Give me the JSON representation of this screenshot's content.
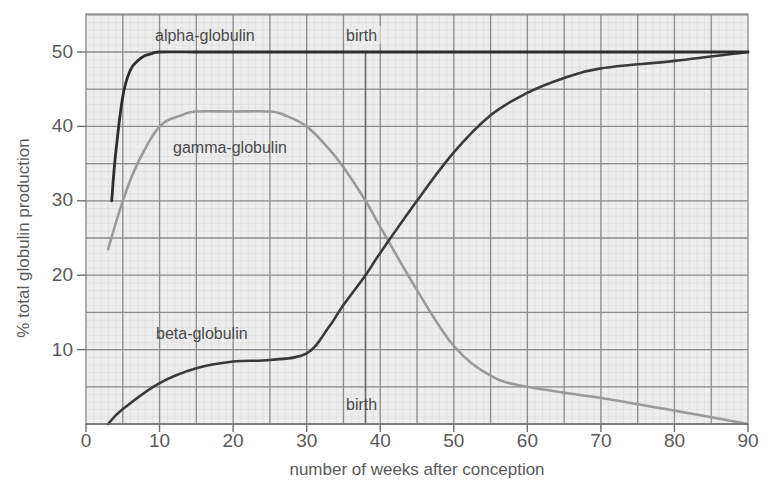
{
  "chart_data": {
    "type": "line",
    "title": "",
    "xlabel": "number of weeks after conception",
    "ylabel": "% total globulin production",
    "xlim": [
      0,
      90
    ],
    "ylim": [
      0,
      55
    ],
    "xticks": [
      0,
      10,
      20,
      30,
      40,
      50,
      60,
      70,
      80,
      90
    ],
    "yticks": [
      10,
      20,
      30,
      40,
      50
    ],
    "xtick_labels": [
      "0",
      "10",
      "20",
      "30",
      "40",
      "50",
      "60",
      "70",
      "80",
      "90"
    ],
    "ytick_labels": [
      "10",
      "20",
      "30",
      "40",
      "50"
    ],
    "grid": true,
    "background": "graph paper",
    "annotations": [
      {
        "text": "birth",
        "x": 38,
        "position": "top"
      },
      {
        "text": "birth",
        "x": 38,
        "position": "bottom"
      }
    ],
    "vline": {
      "x": 38,
      "label": "birth"
    },
    "series": [
      {
        "name": "alpha-globulin",
        "color": "#333333",
        "x": [
          3.5,
          4,
          5,
          6,
          7,
          8,
          9,
          10,
          15,
          20,
          30,
          40,
          50,
          60,
          70,
          80,
          90
        ],
        "y": [
          30,
          36,
          44,
          47.5,
          48.8,
          49.5,
          49.8,
          50,
          50,
          50,
          50,
          50,
          50,
          50,
          50,
          50,
          50
        ]
      },
      {
        "name": "gamma-globulin",
        "color": "#999999",
        "x": [
          3,
          5,
          7,
          10,
          13,
          15,
          20,
          25,
          27,
          30,
          33,
          35,
          38,
          40,
          45,
          50,
          55,
          60,
          70,
          80,
          90
        ],
        "y": [
          23.5,
          30,
          35,
          40,
          41.5,
          42,
          42,
          42,
          41.5,
          40,
          37,
          34.5,
          30,
          26.5,
          18,
          10.5,
          6.5,
          5,
          3.5,
          1.8,
          0
        ]
      },
      {
        "name": "beta-globulin",
        "color": "#3a3a3a",
        "x": [
          3,
          5,
          10,
          15,
          20,
          25,
          30,
          33,
          35,
          38,
          40,
          45,
          50,
          55,
          60,
          65,
          70,
          80,
          90
        ],
        "y": [
          0,
          2,
          5.5,
          7.5,
          8.4,
          8.6,
          9.5,
          13,
          16,
          20,
          23,
          30,
          36.5,
          41.5,
          44.5,
          46.5,
          47.8,
          48.8,
          50
        ]
      }
    ],
    "curve_labels": [
      {
        "text": "alpha-globulin",
        "x": 15,
        "y": 52
      },
      {
        "text": "gamma-globulin",
        "x": 19,
        "y": 37
      },
      {
        "text": "beta-globulin",
        "x": 15,
        "y": 11
      }
    ]
  },
  "labels": {
    "xlabel": "number of weeks after conception",
    "ylabel": "% total globulin production",
    "alpha": "alpha-globulin",
    "gamma": "gamma-globulin",
    "beta": "beta-globulin",
    "birth_top": "birth",
    "birth_bottom": "birth",
    "x0": "0",
    "x10": "10",
    "x20": "20",
    "x30": "30",
    "x40": "40",
    "x50": "50",
    "x60": "60",
    "x70": "70",
    "x80": "80",
    "x90": "90",
    "y10": "10",
    "y20": "20",
    "y30": "30",
    "y40": "40",
    "y50": "50"
  }
}
